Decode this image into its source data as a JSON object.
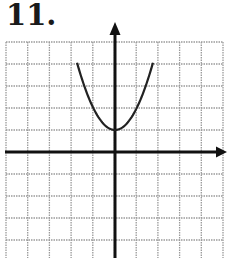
{
  "problem": {
    "number_label": "11."
  },
  "chart_data": {
    "type": "line",
    "title": "",
    "xlabel": "",
    "ylabel": "",
    "grid": true,
    "xlim": [
      -5,
      5
    ],
    "ylim": [
      -5,
      5
    ],
    "axes": {
      "x_axis_arrow": "right",
      "y_axis_arrow": "up"
    },
    "series": [
      {
        "name": "parabola",
        "equation": "y = x^2 + 1",
        "vertex": [
          0,
          1
        ],
        "opens": "up",
        "x": [
          -1.75,
          -1.5,
          -1,
          -0.5,
          0,
          0.5,
          1,
          1.5,
          1.75
        ],
        "y": [
          4.06,
          3.25,
          2,
          1.25,
          1,
          1.25,
          2,
          3.25,
          4.06
        ]
      }
    ],
    "colors": {
      "grid": "#9a9a9a",
      "axes": "#111111",
      "curve": "#222222"
    }
  }
}
